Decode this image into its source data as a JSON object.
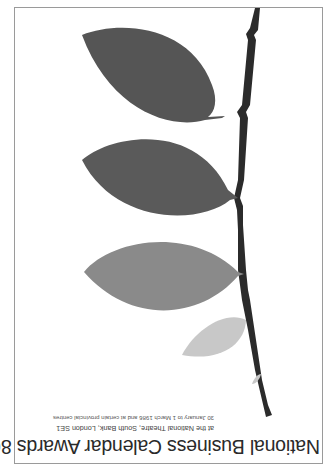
{
  "poster": {
    "title": "National Business Calendar Awards 86",
    "venue": "at the National Theatre, South Bank, London SE1",
    "dates": "30 January to 1 March 1986 and at certain provincial centres",
    "orientation": "rotated 180 degrees",
    "colors": {
      "background": "#ffffff",
      "frame": "#9a9a9a",
      "stem": "#2b2b2b",
      "leaf_dark": "#555555",
      "leaf_dark2": "#5a5a5a",
      "leaf_mid": "#8a8a8a",
      "leaf_light": "#c8c8c8"
    },
    "leaves": [
      {
        "name": "top-leaf",
        "shade": "dark"
      },
      {
        "name": "second-leaf",
        "shade": "dark"
      },
      {
        "name": "third-leaf",
        "shade": "mid"
      },
      {
        "name": "small-leaf",
        "shade": "light"
      }
    ]
  }
}
